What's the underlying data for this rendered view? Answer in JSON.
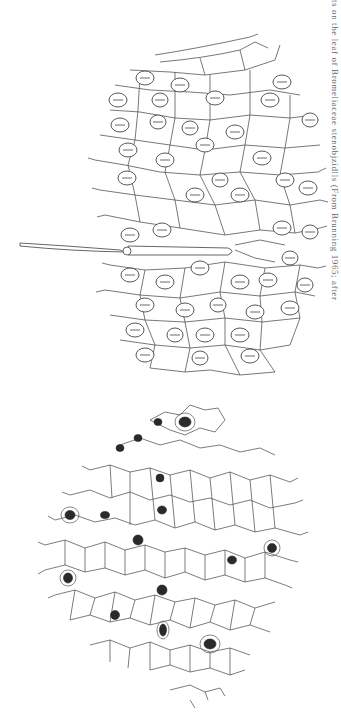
{
  "figure": {
    "orientation": "rotated 90 degrees (landscape page shown in portrait)",
    "panels": [
      {
        "id": "upper",
        "subject": "leaf epidermis with large cells, numerous stomata and a long trichome (hair)",
        "stomata_count_approx": 45,
        "has_trichome": true
      },
      {
        "id": "lower",
        "subject": "leaf epidermis with small polygonal cells and dark sunken stomata",
        "stomata_count_approx": 17,
        "has_trichome": false
      }
    ],
    "caption": "ts on the leaf of Bromeliaceae stenobjzidlls (From Brunning 1965; after"
  },
  "colors": {
    "background": "#ffffff",
    "line": "#555555",
    "stoma_dark": "#2a2a2a"
  }
}
